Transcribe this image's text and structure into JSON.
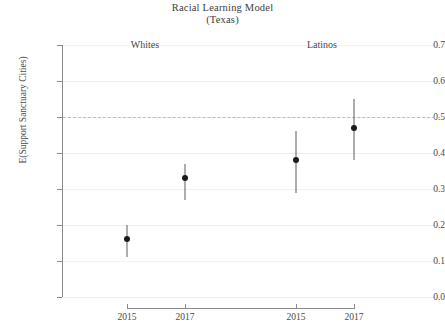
{
  "chart_data": {
    "type": "scatter",
    "title": "Racial Learning Model",
    "subtitle": "(Texas)",
    "xlabel": "",
    "ylabel": "E(Support Sanctuary Cities)",
    "ylim": [
      0.0,
      0.7
    ],
    "yticks": [
      "0.0",
      "0.1",
      "0.2",
      "0.3",
      "0.4",
      "0.5",
      "0.6",
      "0.7"
    ],
    "ytick_values": [
      0.0,
      0.1,
      0.2,
      0.3,
      0.4,
      0.5,
      0.6,
      0.7
    ],
    "grid": true,
    "legend": "none",
    "reference_line": {
      "y": 0.5,
      "style": "dashed",
      "color": "#bdbdbd"
    },
    "group_labels": [
      "Whites",
      "Latinos"
    ],
    "categories": [
      "2015",
      "2017",
      "2015",
      "2017"
    ],
    "points": [
      {
        "group": "Whites",
        "year": "2015",
        "value": 0.16,
        "low": 0.11,
        "high": 0.2
      },
      {
        "group": "Whites",
        "year": "2017",
        "value": 0.33,
        "low": 0.27,
        "high": 0.37
      },
      {
        "group": "Latinos",
        "year": "2015",
        "value": 0.38,
        "low": 0.29,
        "high": 0.46
      },
      {
        "group": "Latinos",
        "year": "2017",
        "value": 0.47,
        "low": 0.38,
        "high": 0.55
      }
    ],
    "marker_color": "#1a1a1a",
    "errorbar_color": "#5c5c5c"
  }
}
